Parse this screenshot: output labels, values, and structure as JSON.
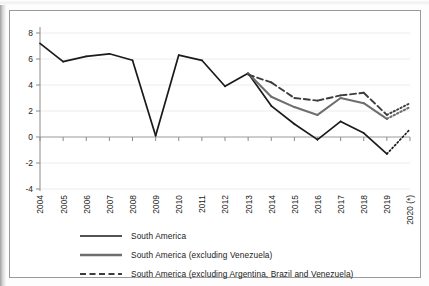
{
  "chart_data": {
    "type": "line",
    "title": "",
    "subtitle": "",
    "xlabel": "",
    "ylabel": "",
    "grid": true,
    "legend_position": "bottom",
    "ylim": [
      -4,
      8
    ],
    "yticks": [
      "8",
      "6",
      "4",
      "2",
      "0",
      "-2",
      "-4"
    ],
    "categories": [
      "2004",
      "2005",
      "2006",
      "2007",
      "2008",
      "2009",
      "2010",
      "2011",
      "2012",
      "2013",
      "2014",
      "2015",
      "2016",
      "2017",
      "2018",
      "2019",
      "2020 (*)"
    ],
    "series": [
      {
        "name": "South America",
        "color": "#1a1a1a",
        "style": "solid",
        "width": 1.7,
        "projection_from": "2019",
        "values": [
          7.2,
          5.8,
          6.2,
          6.4,
          5.9,
          0.1,
          6.3,
          5.9,
          3.9,
          4.9,
          2.4,
          1.0,
          -0.2,
          1.2,
          0.3,
          -1.3,
          0.6
        ]
      },
      {
        "name": "South America (excluding Venezuela)",
        "color": "#6e6e6e",
        "style": "solid",
        "width": 2.1,
        "projection_from": "2019",
        "values": [
          null,
          null,
          null,
          null,
          null,
          null,
          null,
          null,
          null,
          4.9,
          3.1,
          2.3,
          1.7,
          3.0,
          2.6,
          1.4,
          2.3
        ]
      },
      {
        "name": "South America (excluding Argentina, Brazil and Venezuela)",
        "color": "#3d3d3d",
        "style": "dashed",
        "width": 1.9,
        "projection_from": "2019",
        "values": [
          null,
          null,
          null,
          null,
          null,
          null,
          null,
          null,
          null,
          4.8,
          4.2,
          3.0,
          2.8,
          3.2,
          3.4,
          1.7,
          2.6
        ]
      }
    ]
  },
  "legend": {
    "items": [
      {
        "label": "South America"
      },
      {
        "label": "South America (excluding Venezuela)"
      },
      {
        "label": "South America (excluding Argentina, Brazil and Venezuela)"
      }
    ]
  }
}
